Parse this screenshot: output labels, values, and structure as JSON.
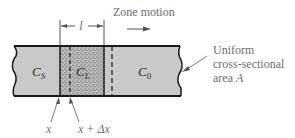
{
  "diagram": {
    "colors": {
      "bar_fill": "#c9c9c9",
      "zone_fill": "#b8b8b8",
      "outline": "#1a1a1a",
      "label_text": "#6e6e6e",
      "region_text": "#2b2b2b",
      "background": "#ffffff"
    },
    "zone_motion_label": "Zone motion",
    "zone_width_label": "l",
    "regions": {
      "solid": {
        "symbol": "C",
        "subscript": "S"
      },
      "liquid": {
        "symbol": "C",
        "subscript": "L"
      },
      "initial": {
        "symbol": "C",
        "subscript": "0"
      }
    },
    "callout": {
      "line1": "Uniform",
      "line2": "cross-sectional",
      "line3_prefix": "area ",
      "line3_var": "A"
    },
    "position_labels": {
      "x": "x",
      "x_plus_dx": "x + Δx"
    }
  }
}
